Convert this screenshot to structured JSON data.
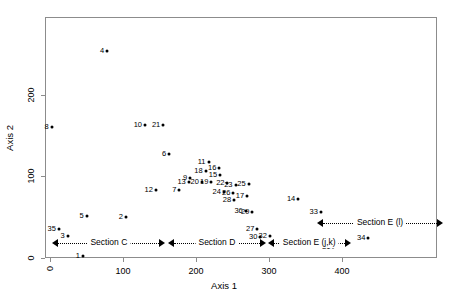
{
  "chart_data": {
    "type": "scatter",
    "title": "",
    "xlabel": "Axis 1",
    "ylabel": "Axis 2",
    "xlim": [
      -7,
      530
    ],
    "ylim": [
      0,
      295
    ],
    "xticks": [
      0,
      100,
      200,
      300,
      400
    ],
    "xticklabels": [
      "0",
      "100",
      "200",
      "300",
      "400"
    ],
    "yticks": [
      0,
      100,
      200
    ],
    "yticklabels": [
      "0",
      "100",
      "200"
    ],
    "grid": false,
    "legend": null,
    "point_label_position": "left-of-marker",
    "points": [
      {
        "label": "1",
        "x": 45,
        "y": 2
      },
      {
        "label": "2",
        "x": 104,
        "y": 50
      },
      {
        "label": "3",
        "x": 24,
        "y": 27
      },
      {
        "label": "4",
        "x": 78,
        "y": 253
      },
      {
        "label": "5",
        "x": 50,
        "y": 52
      },
      {
        "label": "6",
        "x": 163,
        "y": 127
      },
      {
        "label": "7",
        "x": 177,
        "y": 83
      },
      {
        "label": "8",
        "x": 2,
        "y": 160
      },
      {
        "label": "9",
        "x": 192,
        "y": 98
      },
      {
        "label": "10",
        "x": 130,
        "y": 163
      },
      {
        "label": "11",
        "x": 217,
        "y": 117
      },
      {
        "label": "12",
        "x": 145,
        "y": 83
      },
      {
        "label": "13",
        "x": 190,
        "y": 93
      },
      {
        "label": "14",
        "x": 340,
        "y": 72
      },
      {
        "label": "15",
        "x": 233,
        "y": 101
      },
      {
        "label": "16",
        "x": 232,
        "y": 110
      },
      {
        "label": "17",
        "x": 270,
        "y": 76
      },
      {
        "label": "18",
        "x": 213,
        "y": 107
      },
      {
        "label": "19",
        "x": 221,
        "y": 93
      },
      {
        "label": "20",
        "x": 208,
        "y": 93
      },
      {
        "label": "21",
        "x": 155,
        "y": 163
      },
      {
        "label": "22",
        "x": 243,
        "y": 92
      },
      {
        "label": "23",
        "x": 254,
        "y": 89
      },
      {
        "label": "24",
        "x": 238,
        "y": 81
      },
      {
        "label": "25",
        "x": 272,
        "y": 90
      },
      {
        "label": "26",
        "x": 251,
        "y": 80
      },
      {
        "label": "27",
        "x": 284,
        "y": 35
      },
      {
        "label": "28",
        "x": 252,
        "y": 71
      },
      {
        "label": "29",
        "x": 277,
        "y": 56
      },
      {
        "label": "30",
        "x": 288,
        "y": 26
      },
      {
        "label": "31",
        "x": 388,
        "y": 14
      },
      {
        "label": "32",
        "x": 301,
        "y": 27
      },
      {
        "label": "33",
        "x": 371,
        "y": 56
      },
      {
        "label": "34",
        "x": 436,
        "y": 25
      },
      {
        "label": "35",
        "x": 12,
        "y": 35
      },
      {
        "label": "36",
        "x": 268,
        "y": 58
      }
    ],
    "annotations": [
      {
        "name": "section-c",
        "text": "Section C",
        "x_start": 3,
        "x_end": 158,
        "y": 18,
        "style": "double-arrow-dotted"
      },
      {
        "name": "section-d",
        "text": "Section D",
        "x_start": 161,
        "x_end": 296,
        "y": 18,
        "style": "double-arrow-dotted"
      },
      {
        "name": "section-e-jk",
        "text": "Section E (j,k)",
        "x_start": 298,
        "x_end": 412,
        "y": 18,
        "style": "double-arrow-dotted"
      },
      {
        "name": "section-e-l",
        "text": "Section E (l)",
        "x_start": 366,
        "x_end": 538,
        "y": 43,
        "style": "double-arrow-dotted"
      }
    ]
  }
}
